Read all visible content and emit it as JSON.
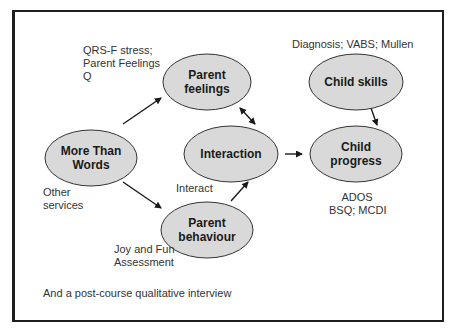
{
  "nodes": [
    {
      "id": "parent-feelings",
      "lines": [
        "Parent",
        "feelings"
      ],
      "cx": 207,
      "cy": 82,
      "rx": 44,
      "ry": 28
    },
    {
      "id": "more-than-words",
      "lines": [
        "More Than",
        "Words"
      ],
      "cx": 91,
      "cy": 158,
      "rx": 46,
      "ry": 28
    },
    {
      "id": "interaction",
      "lines": [
        "Interaction"
      ],
      "cx": 231,
      "cy": 154,
      "rx": 47,
      "ry": 28
    },
    {
      "id": "parent-behaviour",
      "lines": [
        "Parent",
        "behaviour"
      ],
      "cx": 207,
      "cy": 230,
      "rx": 46,
      "ry": 28
    },
    {
      "id": "child-skills",
      "lines": [
        "Child skills"
      ],
      "cx": 356,
      "cy": 82,
      "rx": 47,
      "ry": 28
    },
    {
      "id": "child-progress",
      "lines": [
        "Child",
        "progress"
      ],
      "cx": 356,
      "cy": 154,
      "rx": 46,
      "ry": 28
    }
  ],
  "edges": [
    {
      "from": "more-than-words",
      "to": "parent-feelings",
      "x1": 123,
      "y1": 124,
      "x2": 161,
      "y2": 98,
      "bidirectional": false
    },
    {
      "from": "more-than-words",
      "to": "parent-behaviour",
      "x1": 123,
      "y1": 182,
      "x2": 161,
      "y2": 208,
      "bidirectional": false
    },
    {
      "from": "parent-feelings",
      "to": "interaction",
      "x1": 240,
      "y1": 108,
      "x2": 255,
      "y2": 124,
      "bidirectional": true
    },
    {
      "from": "parent-behaviour",
      "to": "interaction",
      "x1": 231,
      "y1": 201,
      "x2": 248,
      "y2": 182,
      "bidirectional": false
    },
    {
      "from": "interaction",
      "to": "child-progress",
      "x1": 285,
      "y1": 154,
      "x2": 302,
      "y2": 154,
      "bidirectional": false
    },
    {
      "from": "child-skills",
      "to": "child-progress",
      "x1": 371,
      "y1": 108,
      "x2": 377,
      "y2": 125,
      "bidirectional": false
    }
  ],
  "annotations": {
    "parent_feelings_measures": "QRS-F stress;\nParent Feelings\nQ",
    "child_skills_measures": "Diagnosis; VABS; Mullen",
    "other_services": "Other\nservices",
    "interact": "Interact",
    "joy_and_fun": "Joy and Fun\nAssessment",
    "child_progress_measures": "ADOS\nBSQ; MCDI",
    "footer": "And a post-course qualitative interview"
  },
  "colors": {
    "node_fill": "#d9d9d9",
    "node_stroke": "#333333",
    "border": "#1e1e1e",
    "text": "#333333"
  }
}
